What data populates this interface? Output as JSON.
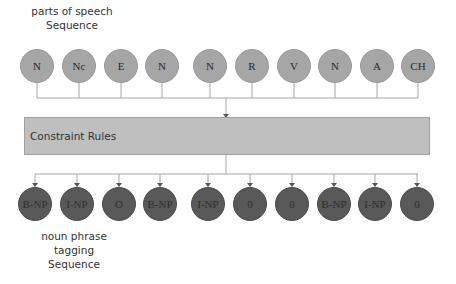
{
  "top_label": {
    "line1": "parts of speech",
    "line2": "Sequence"
  },
  "pos_sequence": [
    "N",
    "Nc",
    "E",
    "N",
    "N",
    "R",
    "V",
    "N",
    "A",
    "CH"
  ],
  "constraint_box": {
    "label": "Constraint Rules"
  },
  "np_sequence": [
    "B-NP",
    "I-NP",
    "O",
    "B-NP",
    "I-NP",
    "0",
    "0",
    "B-NP",
    "I-NP",
    "0"
  ],
  "bottom_label": {
    "line1": "noun phrase",
    "line2": "tagging",
    "line3": "Sequence"
  },
  "colors": {
    "pos_circle": "#a6a6a6",
    "np_circle": "#595959",
    "box": "#bfbfbf",
    "line": "#a6a6a6"
  }
}
